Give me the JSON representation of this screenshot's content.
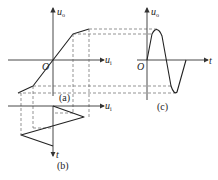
{
  "panels": {
    "a": {
      "caption": "(a)",
      "y_axis_label": "u",
      "y_axis_sub": "o",
      "x_axis_label": "u",
      "x_axis_sub": "i",
      "origin_label": "O",
      "description": "Piecewise-linear transfer characteristic u_o vs u_i with saturation knees"
    },
    "b": {
      "caption": "(b)",
      "x_axis_label": "u",
      "x_axis_sub": "i",
      "t_axis_label": "t",
      "description": "Triangle-wave input u_i plotted with time pointing downward"
    },
    "c": {
      "caption": "(c)",
      "y_axis_label": "u",
      "y_axis_sub": "o",
      "x_axis_label": "t",
      "origin_label": "O",
      "description": "Output waveform u_o(t) with soft-limited peaks"
    }
  },
  "colors": {
    "line": "#222222",
    "dash": "#666666",
    "background": "#ffffff"
  }
}
